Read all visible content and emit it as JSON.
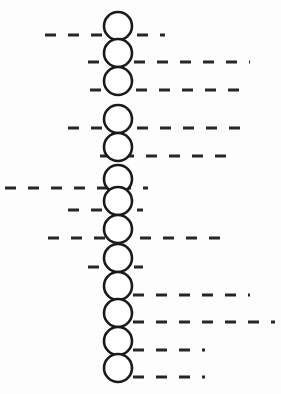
{
  "canvas": {
    "width": 281,
    "height": 394,
    "background_color": "#fdfdfd"
  },
  "style": {
    "node_stroke_color": "#1a1a1a",
    "node_fill_color": "#ffffff",
    "node_stroke_width": 2.6,
    "node_radius": 14,
    "dash_color": "#262626",
    "dash_stroke_width": 3,
    "dash_pattern": "11 12"
  },
  "diagram": {
    "title": "",
    "node_count": 13,
    "node_center_x": 118,
    "nodes": [
      {
        "index": 1,
        "label": "",
        "cy": 26,
        "line_y": 35,
        "line_x1": 45,
        "line_x2": 165
      },
      {
        "index": 2,
        "label": "",
        "cy": 53,
        "line_y": 62,
        "line_x1": 88,
        "line_x2": 250
      },
      {
        "index": 3,
        "label": "",
        "cy": 81,
        "line_y": 90,
        "line_x1": 90,
        "line_x2": 245
      },
      {
        "index": 4,
        "label": "",
        "cy": 119,
        "line_y": 128,
        "line_x1": 68,
        "line_x2": 250
      },
      {
        "index": 5,
        "label": "",
        "cy": 147,
        "line_y": 156,
        "line_x1": 100,
        "line_x2": 228
      },
      {
        "index": 6,
        "label": "",
        "cy": 179,
        "line_y": 188,
        "line_x1": 5,
        "line_x2": 148
      },
      {
        "index": 7,
        "label": "",
        "cy": 201,
        "line_y": 210,
        "line_x1": 68,
        "line_x2": 143
      },
      {
        "index": 8,
        "label": "",
        "cy": 229,
        "line_y": 238,
        "line_x1": 48,
        "line_x2": 230
      },
      {
        "index": 9,
        "label": "",
        "cy": 258,
        "line_y": 267,
        "line_x1": 88,
        "line_x2": 143
      },
      {
        "index": 10,
        "label": "",
        "cy": 286,
        "line_y": 295,
        "line_x1": 110,
        "line_x2": 250
      },
      {
        "index": 11,
        "label": "",
        "cy": 313,
        "line_y": 322,
        "line_x1": 110,
        "line_x2": 275
      },
      {
        "index": 12,
        "label": "",
        "cy": 341,
        "line_y": 350,
        "line_x1": 110,
        "line_x2": 205
      },
      {
        "index": 13,
        "label": "",
        "cy": 368,
        "line_y": 377,
        "line_x1": 110,
        "line_x2": 205
      }
    ]
  }
}
